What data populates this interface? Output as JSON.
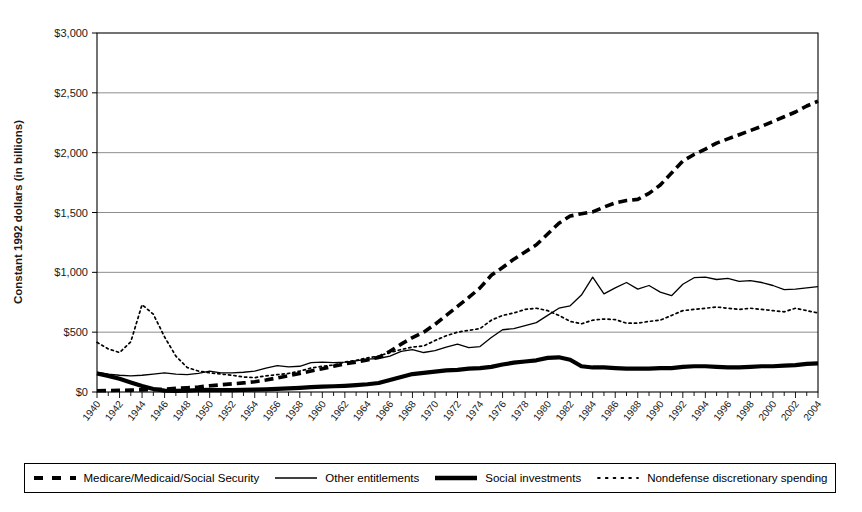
{
  "chart_data": {
    "type": "line",
    "title": "",
    "xlabel": "",
    "ylabel": "Constant 1992 dollars (in billions)",
    "ylim": [
      0,
      3000
    ],
    "xlim": [
      1940,
      2004
    ],
    "ytick_values": [
      0,
      500,
      1000,
      1500,
      2000,
      2500,
      3000
    ],
    "ytick_labels": [
      "$0",
      "$500",
      "$1,000",
      "$1,500",
      "$2,000",
      "$2,500",
      "$3,000"
    ],
    "xtick_labels": [
      "1940",
      "1942",
      "1944",
      "1946",
      "1948",
      "1950",
      "1952",
      "1954",
      "1956",
      "1958",
      "1960",
      "1962",
      "1964",
      "1966",
      "1968",
      "1970",
      "1972",
      "1974",
      "1976",
      "1978",
      "1980",
      "1982",
      "1984",
      "1986",
      "1988",
      "1990",
      "1992",
      "1994",
      "1996",
      "1998",
      "2000",
      "2002",
      "2004"
    ],
    "x": [
      1940,
      1941,
      1942,
      1943,
      1944,
      1945,
      1946,
      1947,
      1948,
      1949,
      1950,
      1951,
      1952,
      1953,
      1954,
      1955,
      1956,
      1957,
      1958,
      1959,
      1960,
      1961,
      1962,
      1963,
      1964,
      1965,
      1966,
      1967,
      1968,
      1969,
      1970,
      1971,
      1972,
      1973,
      1974,
      1975,
      1976,
      1977,
      1978,
      1979,
      1980,
      1981,
      1982,
      1983,
      1984,
      1985,
      1986,
      1987,
      1988,
      1989,
      1990,
      1991,
      1992,
      1993,
      1994,
      1995,
      1996,
      1997,
      1998,
      1999,
      2000,
      2001,
      2002,
      2003,
      2004
    ],
    "grid": "horizontal",
    "legend_position": "bottom",
    "series": [
      {
        "name": "Medicare/Medicaid/Social Security",
        "style": "thick-dashed",
        "color": "#000000",
        "values": [
          10,
          12,
          14,
          16,
          18,
          20,
          24,
          30,
          36,
          42,
          52,
          60,
          68,
          76,
          86,
          100,
          118,
          135,
          155,
          175,
          195,
          215,
          235,
          250,
          268,
          290,
          340,
          400,
          455,
          500,
          565,
          640,
          715,
          790,
          870,
          975,
          1040,
          1110,
          1170,
          1230,
          1320,
          1410,
          1470,
          1490,
          1505,
          1545,
          1580,
          1600,
          1610,
          1660,
          1730,
          1830,
          1930,
          1985,
          2030,
          2080,
          2115,
          2150,
          2185,
          2220,
          2260,
          2300,
          2340,
          2390,
          2430
        ]
      },
      {
        "name": "Other entitlements",
        "style": "thin-solid",
        "color": "#000000",
        "values": [
          165,
          150,
          140,
          135,
          140,
          150,
          160,
          150,
          145,
          155,
          175,
          160,
          160,
          165,
          175,
          200,
          220,
          210,
          215,
          245,
          250,
          245,
          250,
          260,
          275,
          280,
          300,
          340,
          355,
          330,
          345,
          375,
          400,
          370,
          380,
          455,
          520,
          530,
          555,
          580,
          640,
          700,
          720,
          810,
          960,
          820,
          870,
          915,
          860,
          890,
          835,
          805,
          900,
          955,
          960,
          940,
          950,
          925,
          930,
          915,
          890,
          855,
          860,
          870,
          880
        ]
      },
      {
        "name": "Social investments",
        "style": "thick-solid",
        "color": "#000000",
        "values": [
          155,
          135,
          110,
          80,
          50,
          25,
          12,
          10,
          12,
          15,
          18,
          16,
          16,
          18,
          20,
          22,
          26,
          30,
          34,
          40,
          45,
          48,
          52,
          58,
          65,
          75,
          100,
          125,
          150,
          160,
          170,
          180,
          185,
          195,
          200,
          210,
          230,
          245,
          255,
          265,
          285,
          290,
          270,
          215,
          205,
          205,
          200,
          195,
          195,
          195,
          200,
          200,
          210,
          215,
          215,
          210,
          205,
          205,
          210,
          215,
          215,
          220,
          225,
          235,
          240
        ]
      },
      {
        "name": "Nondefense discretionary spending",
        "style": "dotted",
        "color": "#000000",
        "values": [
          415,
          360,
          330,
          420,
          730,
          650,
          460,
          300,
          205,
          175,
          160,
          150,
          140,
          125,
          120,
          135,
          145,
          155,
          175,
          200,
          215,
          225,
          250,
          265,
          285,
          300,
          330,
          355,
          375,
          385,
          430,
          470,
          500,
          515,
          530,
          600,
          640,
          660,
          690,
          700,
          680,
          640,
          590,
          570,
          600,
          610,
          605,
          575,
          575,
          590,
          600,
          640,
          680,
          690,
          700,
          710,
          700,
          690,
          700,
          690,
          680,
          670,
          700,
          680,
          660
        ]
      }
    ]
  },
  "legend": {
    "items": [
      {
        "label": "Medicare/Medicaid/Social Security",
        "swatch": "thick-dashed-swatch"
      },
      {
        "label": "Other entitlements",
        "swatch": "thin-solid-swatch"
      },
      {
        "label": "Social investments",
        "swatch": "thick-solid-swatch"
      },
      {
        "label": "Nondefense discretionary spending",
        "swatch": "dotted-swatch"
      }
    ]
  }
}
